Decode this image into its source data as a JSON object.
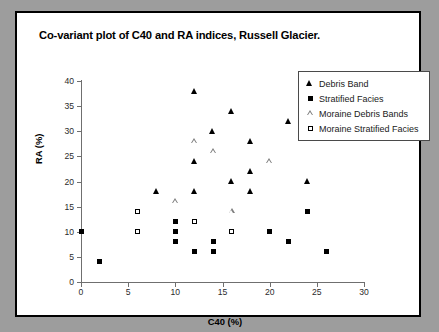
{
  "chart_data": {
    "type": "scatter",
    "title": "Co-variant plot of C40 and RA indices, Russell Glacier.",
    "xlabel": "C40 (%)",
    "ylabel": "RA (%)",
    "xlim": [
      0,
      30
    ],
    "ylim": [
      0,
      40
    ],
    "xticks": [
      0,
      5,
      10,
      15,
      20,
      25,
      30
    ],
    "yticks": [
      0,
      5,
      10,
      15,
      20,
      25,
      30,
      35,
      40
    ],
    "grid": false,
    "legend_position": "top-right",
    "series": [
      {
        "name": "Debris Band",
        "marker": "filled-triangle",
        "color": "#000000",
        "points": [
          [
            8,
            18
          ],
          [
            12,
            38
          ],
          [
            12,
            24
          ],
          [
            12,
            18
          ],
          [
            14,
            30
          ],
          [
            16,
            34
          ],
          [
            16,
            20
          ],
          [
            18,
            28
          ],
          [
            18,
            22
          ],
          [
            18,
            18
          ],
          [
            22,
            32
          ],
          [
            24,
            20
          ]
        ]
      },
      {
        "name": "Stratified Facies",
        "marker": "filled-square",
        "color": "#000000",
        "points": [
          [
            0,
            10
          ],
          [
            2,
            4
          ],
          [
            10,
            12
          ],
          [
            10,
            10
          ],
          [
            10,
            8
          ],
          [
            12,
            6
          ],
          [
            14,
            8
          ],
          [
            14,
            6
          ],
          [
            20,
            10
          ],
          [
            22,
            8
          ],
          [
            24,
            14
          ],
          [
            26,
            6
          ]
        ]
      },
      {
        "name": "Moraine Debris Bands",
        "marker": "open-triangle",
        "color": "#808080",
        "points": [
          [
            10,
            16
          ],
          [
            12,
            28
          ],
          [
            14,
            26
          ],
          [
            16,
            14
          ],
          [
            20,
            24
          ]
        ]
      },
      {
        "name": "Moraine Stratified Facies",
        "marker": "open-square",
        "color": "#000000",
        "points": [
          [
            6,
            14
          ],
          [
            6,
            10
          ],
          [
            12,
            12
          ],
          [
            16,
            10
          ]
        ]
      }
    ]
  }
}
